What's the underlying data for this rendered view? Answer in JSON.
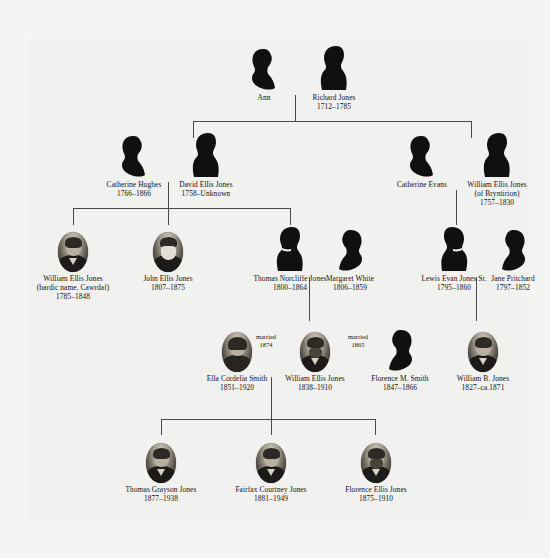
{
  "colors": {
    "background": "#f4f4f2",
    "panel": "#f1f1ef",
    "line": "#4a4a4a",
    "text": "#111111",
    "silhouette": "#101010"
  },
  "generations": [
    {
      "id": "gen-1",
      "people": [
        {
          "id": "ann",
          "name": "Ann",
          "dates": "",
          "figure": "silhouette-female"
        },
        {
          "id": "richard-jones",
          "name": "Richard Jones",
          "dates": "1712–1785",
          "figure": "silhouette-male"
        }
      ]
    },
    {
      "id": "gen-2",
      "people": [
        {
          "id": "catherine-hughes",
          "name": "Catherine Hughes",
          "dates": "1766–1866",
          "figure": "silhouette-female"
        },
        {
          "id": "david-ellis-jones",
          "name": "David Ellis Jones",
          "dates": "1758–Unknown",
          "figure": "silhouette-male"
        },
        {
          "id": "catherine-evans",
          "name": "Catherine Evans",
          "dates": "",
          "figure": "silhouette-female"
        },
        {
          "id": "william-ellis-jones-bryntirion",
          "name": "William Ellis Jones",
          "sub": "(of Bryntirion)",
          "dates": "1757–1830",
          "figure": "silhouette-male"
        }
      ]
    },
    {
      "id": "gen-3",
      "people": [
        {
          "id": "william-ellis-jones-cawrdaf",
          "name": "William Ellis Jones",
          "sub": "(bardic name, Cawrdaf)",
          "dates": "1785–1848",
          "figure": "portrait-male"
        },
        {
          "id": "john-ellis-jones",
          "name": "John Ellis Jones",
          "dates": "1807–1875",
          "figure": "portrait-male-beard"
        },
        {
          "id": "thomas-norcliffe-jones",
          "name": "Thomas Norcliffe Jones",
          "dates": "1800–1864",
          "figure": "silhouette-male"
        },
        {
          "id": "margaret-white",
          "name": "Margaret White",
          "dates": "1806–1859",
          "figure": "silhouette-female"
        },
        {
          "id": "lewis-evan-jones-sr",
          "name": "Lewis Evan Jones Sr.",
          "dates": "1795–1860",
          "figure": "silhouette-male"
        },
        {
          "id": "jane-pritchard",
          "name": "Jane Pritchard",
          "dates": "1797–1852",
          "figure": "silhouette-female"
        }
      ]
    },
    {
      "id": "gen-4",
      "people": [
        {
          "id": "ella-cordelia-smith",
          "name": "Ella Cordelia Smith",
          "dates": "1851–1920",
          "figure": "portrait-female"
        },
        {
          "id": "william-ellis-jones-1838",
          "name": "William Ellis Jones",
          "dates": "1838–1910",
          "figure": "portrait-male-beard"
        },
        {
          "id": "florence-m-smith",
          "name": "Florence M. Smith",
          "dates": "1847–1866",
          "figure": "silhouette-female"
        },
        {
          "id": "william-b-jones",
          "name": "William B. Jones",
          "dates": "1827–ca.1871",
          "figure": "portrait-male"
        }
      ],
      "marriages": [
        {
          "id": "marriage-1874",
          "label": "married",
          "year": "1874"
        },
        {
          "id": "marriage-1865",
          "label": "married",
          "year": "1865"
        }
      ]
    },
    {
      "id": "gen-5",
      "people": [
        {
          "id": "thomas-grayson-jones",
          "name": "Thomas Grayson Jones",
          "dates": "1877–1938",
          "figure": "portrait-male"
        },
        {
          "id": "fairfax-courtney-jones",
          "name": "Fairfax Courtney Jones",
          "dates": "1881–1949",
          "figure": "portrait-male"
        },
        {
          "id": "florence-ellis-jones",
          "name": "Florence Ellis Jones",
          "dates": "1875–1910",
          "figure": "portrait-male-beard"
        }
      ]
    }
  ]
}
